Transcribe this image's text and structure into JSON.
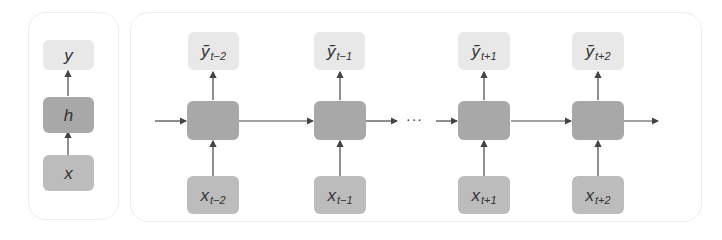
{
  "colors": {
    "output_node": "#e8e8e8",
    "hidden_node": "#a8a8a8",
    "input_node": "#bcbcbc",
    "arrow": "#444444",
    "panel_border": "#ececec"
  },
  "left_panel": {
    "output_label": "y",
    "hidden_label": "h",
    "input_label": "x"
  },
  "unrolled": {
    "ellipsis": "···",
    "steps": [
      {
        "output": "ỹ",
        "output_sub": "t−2",
        "input": "x",
        "input_sub": "t−2"
      },
      {
        "output": "ỹ",
        "output_sub": "t−1",
        "input": "x",
        "input_sub": "t−1"
      },
      {
        "output": "ỹ",
        "output_sub": "t+1",
        "input": "x",
        "input_sub": "t+1"
      },
      {
        "output": "ỹ",
        "output_sub": "t+2",
        "input": "x",
        "input_sub": "t+2"
      }
    ]
  }
}
